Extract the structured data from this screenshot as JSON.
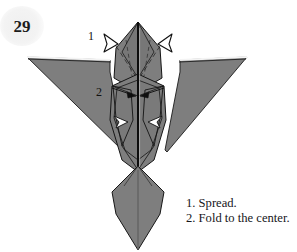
{
  "page": {
    "number": "29",
    "background_color": "#ffffff"
  },
  "figure": {
    "paper_fill": "#7e7e7e",
    "paper_fill_shadow": "#6e6e6e",
    "paper_highlight": "#f2f2f2",
    "line_color": "#111111",
    "markers": [
      {
        "id": "1",
        "label": "1"
      },
      {
        "id": "2",
        "label": "2"
      }
    ],
    "arrows": [
      {
        "name": "spread-arrow-left",
        "style": "hollow"
      },
      {
        "name": "spread-arrow-right",
        "style": "hollow"
      },
      {
        "name": "fold-arrow-left",
        "style": "solid"
      },
      {
        "name": "fold-arrow-right",
        "style": "solid"
      }
    ]
  },
  "caption": {
    "lines": [
      "1. Spread.",
      "2. Fold to the center."
    ],
    "line_1": "1. Spread.",
    "line_2": "2. Fold to the center."
  }
}
